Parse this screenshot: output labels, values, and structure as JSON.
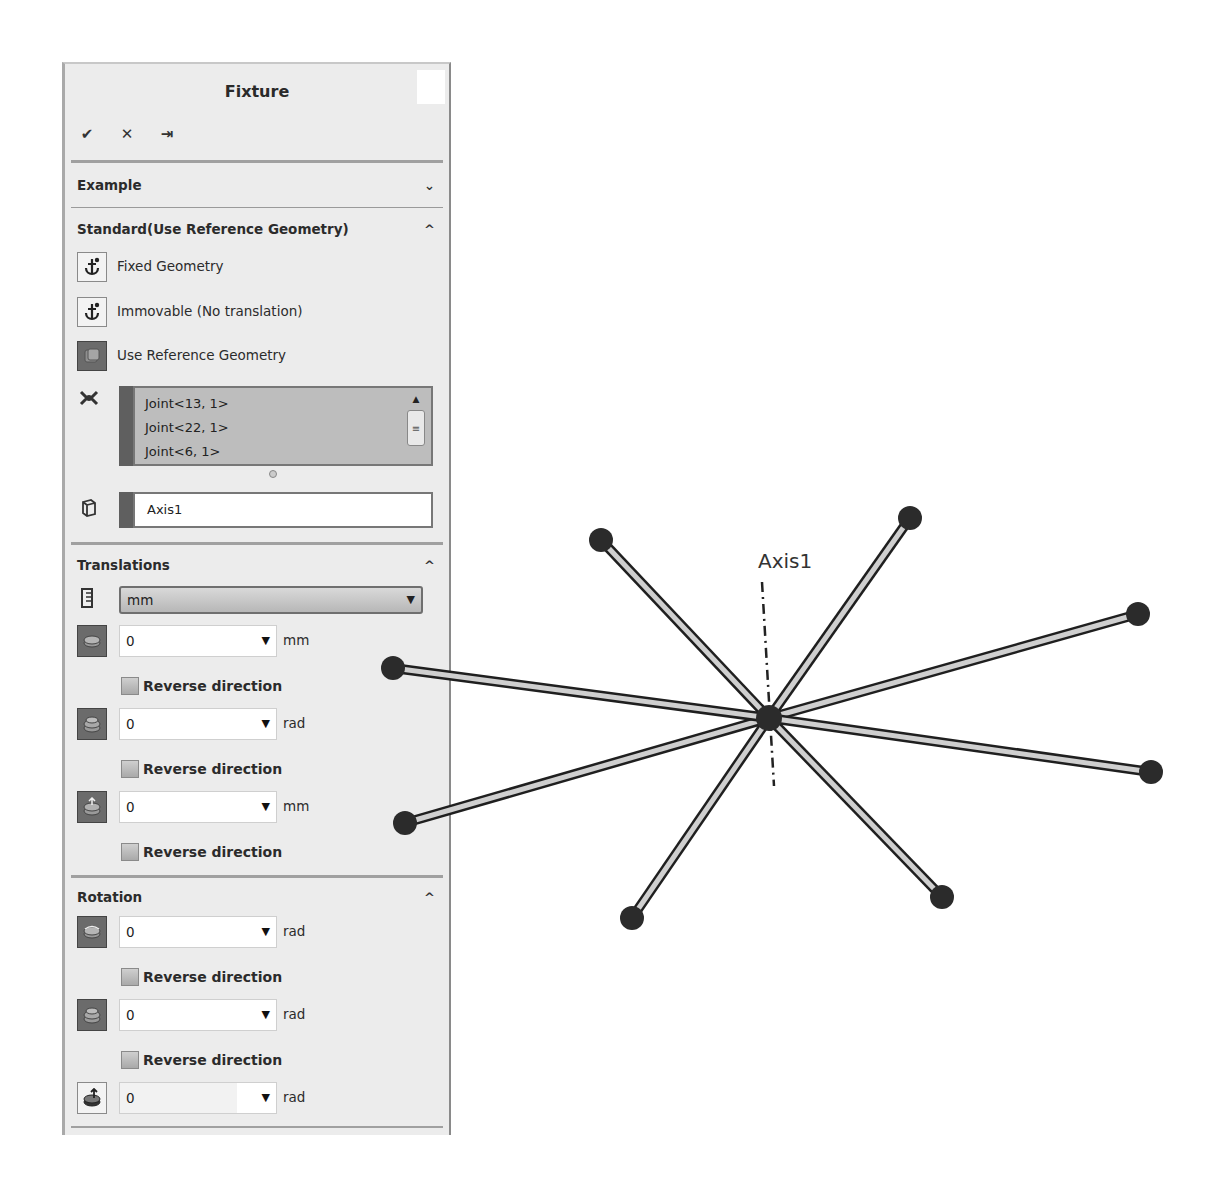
{
  "panel": {
    "title": "Fixture",
    "actions": [
      {
        "name": "ok-button",
        "icon": "checkmark-icon",
        "glyph": "✔"
      },
      {
        "name": "cancel-button",
        "icon": "close-icon",
        "glyph": "✕"
      },
      {
        "name": "pin-button",
        "icon": "pushpin-icon",
        "glyph": "⇥"
      }
    ],
    "sections": {
      "example": {
        "label": "Example",
        "state": "collapsed",
        "chevron": "⌄"
      },
      "standard": {
        "label": "Standard(Use Reference Geometry)",
        "state": "expanded",
        "chevron": "^",
        "options": [
          {
            "label": "Fixed Geometry",
            "icon": "anchor-icon",
            "selected": false
          },
          {
            "label": "Immovable (No translation)",
            "icon": "anchor-icon",
            "selected": false
          },
          {
            "label": "Use Reference Geometry",
            "icon": "reference-geometry-icon",
            "selected": true
          }
        ],
        "joints_list": [
          "Joint<13, 1>",
          "Joint<22, 1>",
          "Joint<6, 1>"
        ],
        "reference": "Axis1"
      },
      "translations": {
        "label": "Translations",
        "chevron": "^",
        "unit_select": "mm",
        "fields": [
          {
            "value": "0",
            "unit": "mm",
            "reverse_label": "Reverse direction",
            "reverse_checked": false
          },
          {
            "value": "0",
            "unit": "rad",
            "reverse_label": "Reverse direction",
            "reverse_checked": false
          },
          {
            "value": "0",
            "unit": "mm",
            "reverse_label": "Reverse direction",
            "reverse_checked": false
          }
        ]
      },
      "rotation": {
        "label": "Rotation",
        "chevron": "^",
        "fields": [
          {
            "value": "0",
            "unit": "rad",
            "reverse_label": "Reverse direction",
            "reverse_checked": false
          },
          {
            "value": "0",
            "unit": "rad",
            "reverse_label": "Reverse direction",
            "reverse_checked": false
          },
          {
            "value": "0",
            "unit": "rad"
          }
        ]
      }
    }
  },
  "viewport": {
    "axis_label": "Axis1",
    "center": [
      769,
      718
    ],
    "joint_endpoints": [
      [
        601,
        540
      ],
      [
        910,
        518
      ],
      [
        1138,
        614
      ],
      [
        1151,
        772
      ],
      [
        942,
        897
      ],
      [
        632,
        918
      ],
      [
        405,
        823
      ],
      [
        393,
        668
      ]
    ],
    "colors": {
      "node": "#2b2b2b",
      "member_fill": "#cfcfcf",
      "member_edge": "#1f1f1f"
    }
  }
}
